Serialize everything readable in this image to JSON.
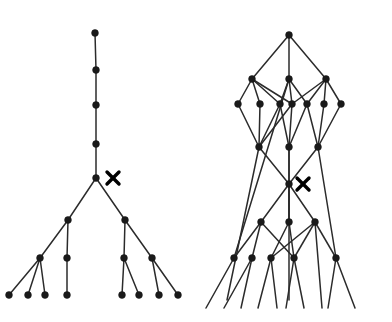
{
  "figure": {
    "background_color": "#ffffff",
    "node_color": "#1a1a1a",
    "edge_color": "#2b2b2b",
    "marker_color": "#000000",
    "canvas": {
      "width": 392,
      "height": 322
    },
    "panels": [
      {
        "name": "left-tree-panel",
        "label": "left tree diagram",
        "marker": {
          "name": "cross-marker",
          "glyph": "x",
          "x": 113,
          "y": 178
        },
        "nodes": [
          {
            "id": "L0",
            "x": 95,
            "y": 33
          },
          {
            "id": "L1",
            "x": 96,
            "y": 70
          },
          {
            "id": "L2",
            "x": 96,
            "y": 105
          },
          {
            "id": "L3",
            "x": 96,
            "y": 144
          },
          {
            "id": "L4",
            "x": 96,
            "y": 178
          },
          {
            "id": "L5",
            "x": 68,
            "y": 220
          },
          {
            "id": "L6",
            "x": 125,
            "y": 220
          },
          {
            "id": "L7",
            "x": 40,
            "y": 258
          },
          {
            "id": "L8",
            "x": 67,
            "y": 258
          },
          {
            "id": "L9",
            "x": 124,
            "y": 258
          },
          {
            "id": "L10",
            "x": 152,
            "y": 258
          },
          {
            "id": "L11",
            "x": 9,
            "y": 295
          },
          {
            "id": "L12",
            "x": 28,
            "y": 295
          },
          {
            "id": "L13",
            "x": 45,
            "y": 295
          },
          {
            "id": "L14",
            "x": 67,
            "y": 295
          },
          {
            "id": "L15",
            "x": 122,
            "y": 295
          },
          {
            "id": "L16",
            "x": 139,
            "y": 295
          },
          {
            "id": "L17",
            "x": 159,
            "y": 295
          },
          {
            "id": "L18",
            "x": 178,
            "y": 295
          }
        ],
        "edges": [
          [
            "L0",
            "L1"
          ],
          [
            "L1",
            "L2"
          ],
          [
            "L2",
            "L3"
          ],
          [
            "L3",
            "L4"
          ],
          [
            "L4",
            "L5"
          ],
          [
            "L4",
            "L6"
          ],
          [
            "L5",
            "L7"
          ],
          [
            "L5",
            "L8"
          ],
          [
            "L6",
            "L9"
          ],
          [
            "L6",
            "L10"
          ],
          [
            "L7",
            "L11"
          ],
          [
            "L7",
            "L12"
          ],
          [
            "L7",
            "L13"
          ],
          [
            "L8",
            "L14"
          ],
          [
            "L9",
            "L15"
          ],
          [
            "L9",
            "L16"
          ],
          [
            "L10",
            "L17"
          ],
          [
            "L10",
            "L18"
          ]
        ]
      },
      {
        "name": "right-lattice-panel",
        "label": "right lattice diagram",
        "marker": {
          "name": "cross-marker",
          "glyph": "x",
          "x": 303,
          "y": 184
        },
        "nodes": [
          {
            "id": "R0",
            "x": 289,
            "y": 35
          },
          {
            "id": "R1",
            "x": 252,
            "y": 79
          },
          {
            "id": "R2",
            "x": 289,
            "y": 79
          },
          {
            "id": "R3",
            "x": 326,
            "y": 79
          },
          {
            "id": "R4",
            "x": 238,
            "y": 104
          },
          {
            "id": "R5",
            "x": 260,
            "y": 104
          },
          {
            "id": "R6",
            "x": 280,
            "y": 104
          },
          {
            "id": "R7",
            "x": 292,
            "y": 104
          },
          {
            "id": "R8",
            "x": 307,
            "y": 104
          },
          {
            "id": "R9",
            "x": 324,
            "y": 104
          },
          {
            "id": "R10",
            "x": 341,
            "y": 104
          },
          {
            "id": "R11",
            "x": 259,
            "y": 147
          },
          {
            "id": "R12",
            "x": 289,
            "y": 147
          },
          {
            "id": "R13",
            "x": 318,
            "y": 147
          },
          {
            "id": "R14",
            "x": 289,
            "y": 184
          },
          {
            "id": "R15",
            "x": 261,
            "y": 222
          },
          {
            "id": "R16",
            "x": 289,
            "y": 222
          },
          {
            "id": "R17",
            "x": 315,
            "y": 222
          },
          {
            "id": "R18",
            "x": 234,
            "y": 258
          },
          {
            "id": "R19",
            "x": 252,
            "y": 258
          },
          {
            "id": "R20",
            "x": 271,
            "y": 258
          },
          {
            "id": "R21",
            "x": 294,
            "y": 258
          },
          {
            "id": "R22",
            "x": 336,
            "y": 258
          }
        ],
        "edges": [
          [
            "R0",
            "R1"
          ],
          [
            "R0",
            "R2"
          ],
          [
            "R0",
            "R3"
          ],
          [
            "R1",
            "R4"
          ],
          [
            "R1",
            "R5"
          ],
          [
            "R1",
            "R6"
          ],
          [
            "R1",
            "R7"
          ],
          [
            "R2",
            "R6"
          ],
          [
            "R2",
            "R7"
          ],
          [
            "R2",
            "R8"
          ],
          [
            "R3",
            "R7"
          ],
          [
            "R3",
            "R8"
          ],
          [
            "R3",
            "R9"
          ],
          [
            "R3",
            "R10"
          ],
          [
            "R4",
            "R11"
          ],
          [
            "R5",
            "R11"
          ],
          [
            "R6",
            "R11"
          ],
          [
            "R7",
            "R12"
          ],
          [
            "R6",
            "R12"
          ],
          [
            "R8",
            "R12"
          ],
          [
            "R8",
            "R13"
          ],
          [
            "R9",
            "R13"
          ],
          [
            "R10",
            "R13"
          ],
          [
            "R7",
            "R11"
          ],
          [
            "R11",
            "R14"
          ],
          [
            "R12",
            "R14"
          ],
          [
            "R13",
            "R14"
          ],
          [
            "R14",
            "R15"
          ],
          [
            "R14",
            "R16"
          ],
          [
            "R14",
            "R17"
          ],
          [
            "R15",
            "R18"
          ],
          [
            "R15",
            "R19"
          ],
          [
            "R15",
            "R21"
          ],
          [
            "R16",
            "R20"
          ],
          [
            "R16",
            "R21"
          ],
          [
            "R17",
            "R20"
          ],
          [
            "R17",
            "R21"
          ],
          [
            "R17",
            "R22"
          ],
          [
            "R18",
            "R2"
          ],
          [
            "R22",
            "R13"
          ]
        ],
        "open_edges": [
          {
            "from": "R11",
            "to": {
              "x": 227,
              "y": 300
            }
          },
          {
            "from": "R12",
            "to": {
              "x": 289,
              "y": 300
            }
          },
          {
            "from": "R18",
            "to": {
              "x": 206,
              "y": 308
            }
          },
          {
            "from": "R19",
            "to": {
              "x": 224,
              "y": 308
            }
          },
          {
            "from": "R19",
            "to": {
              "x": 241,
              "y": 308
            }
          },
          {
            "from": "R20",
            "to": {
              "x": 258,
              "y": 308
            }
          },
          {
            "from": "R20",
            "to": {
              "x": 277,
              "y": 308
            }
          },
          {
            "from": "R21",
            "to": {
              "x": 286,
              "y": 308
            }
          },
          {
            "from": "R21",
            "to": {
              "x": 304,
              "y": 308
            }
          },
          {
            "from": "R17",
            "to": {
              "x": 322,
              "y": 308
            }
          },
          {
            "from": "R22",
            "to": {
              "x": 328,
              "y": 308
            }
          },
          {
            "from": "R22",
            "to": {
              "x": 355,
              "y": 308
            }
          },
          {
            "from": "R14",
            "to": {
              "x": 289,
              "y": 222
            }
          }
        ]
      }
    ]
  }
}
